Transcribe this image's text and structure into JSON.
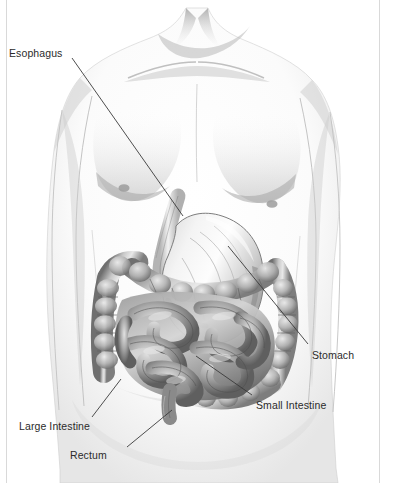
{
  "figure": {
    "medium": "pencil drawing of a male torso with digestive organs",
    "background_color": "#ffffff",
    "frame_color": "#d9d9d9",
    "label_color": "#2b2b2b",
    "leader_line_color": "#3a3a3a"
  },
  "labels": [
    {
      "id": "esophagus",
      "text": "Esophagus",
      "x": 9,
      "y": 47,
      "leader": {
        "x1": 72,
        "y1": 58,
        "x2": 183,
        "y2": 216
      }
    },
    {
      "id": "stomach",
      "text": "Stomach",
      "x": 312,
      "y": 349,
      "leader": {
        "x1": 308,
        "y1": 344,
        "x2": 228,
        "y2": 246
      }
    },
    {
      "id": "small-intestine",
      "text": "Small Intestine",
      "x": 256,
      "y": 399,
      "leader": {
        "x1": 252,
        "y1": 395,
        "x2": 196,
        "y2": 356
      }
    },
    {
      "id": "large-intestine",
      "text": "Large Intestine",
      "x": 19,
      "y": 420,
      "leader": {
        "x1": 92,
        "y1": 417,
        "x2": 121,
        "y2": 379
      }
    },
    {
      "id": "rectum",
      "text": "Rectum",
      "x": 70,
      "y": 449,
      "leader": {
        "x1": 127,
        "y1": 447,
        "x2": 172,
        "y2": 410
      }
    }
  ],
  "organs": [
    {
      "id": "esophagus",
      "name": "Esophagus"
    },
    {
      "id": "stomach",
      "name": "Stomach"
    },
    {
      "id": "small-intestine",
      "name": "Small Intestine"
    },
    {
      "id": "large-intestine",
      "name": "Large Intestine"
    },
    {
      "id": "rectum",
      "name": "Rectum"
    }
  ]
}
